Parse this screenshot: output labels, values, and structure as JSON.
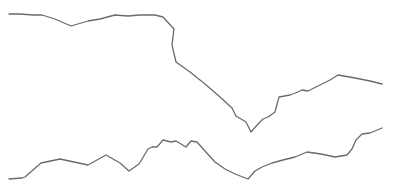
{
  "chart_data": {
    "type": "line",
    "title": "",
    "xlabel": "",
    "ylabel": "",
    "grid": false,
    "legend": "none",
    "axes_visible": false,
    "line_color": "#6b6b6b",
    "background": "#ffffff",
    "series": [
      {
        "name": "upper",
        "points": [
          [
            9,
            14
          ],
          [
            20,
            14
          ],
          [
            33,
            15
          ],
          [
            42,
            15
          ],
          [
            55,
            19
          ],
          [
            71,
            26
          ],
          [
            88,
            21
          ],
          [
            100,
            19
          ],
          [
            115,
            15
          ],
          [
            128,
            16
          ],
          [
            140,
            15
          ],
          [
            155,
            15
          ],
          [
            163,
            17
          ],
          [
            174,
            29
          ],
          [
            172,
            45
          ],
          [
            176,
            62
          ],
          [
            190,
            72
          ],
          [
            205,
            84
          ],
          [
            220,
            97
          ],
          [
            232,
            108
          ],
          [
            236,
            116
          ],
          [
            246,
            122
          ],
          [
            251,
            132
          ],
          [
            258,
            124
          ],
          [
            263,
            119
          ],
          [
            268,
            117
          ],
          [
            275,
            112
          ],
          [
            279,
            97
          ],
          [
            290,
            95
          ],
          [
            298,
            92
          ],
          [
            302,
            90
          ],
          [
            308,
            91
          ],
          [
            318,
            86
          ],
          [
            330,
            80
          ],
          [
            338,
            75
          ],
          [
            355,
            78
          ],
          [
            370,
            81
          ],
          [
            382,
            84
          ]
        ]
      },
      {
        "name": "lower",
        "points": [
          [
            9,
            179
          ],
          [
            22,
            178
          ],
          [
            25,
            177
          ],
          [
            33,
            170
          ],
          [
            41,
            163
          ],
          [
            60,
            159
          ],
          [
            74,
            162
          ],
          [
            88,
            165
          ],
          [
            106,
            155
          ],
          [
            120,
            163
          ],
          [
            129,
            171
          ],
          [
            139,
            164
          ],
          [
            148,
            149
          ],
          [
            152,
            147
          ],
          [
            157,
            147
          ],
          [
            163,
            140
          ],
          [
            171,
            142
          ],
          [
            176,
            141
          ],
          [
            186,
            147
          ],
          [
            191,
            141
          ],
          [
            197,
            142
          ],
          [
            205,
            151
          ],
          [
            215,
            162
          ],
          [
            225,
            169
          ],
          [
            235,
            174
          ],
          [
            248,
            179
          ],
          [
            255,
            171
          ],
          [
            262,
            167
          ],
          [
            272,
            163
          ],
          [
            283,
            160
          ],
          [
            295,
            157
          ],
          [
            307,
            152
          ],
          [
            321,
            154
          ],
          [
            335,
            157
          ],
          [
            347,
            155
          ],
          [
            352,
            149
          ],
          [
            356,
            140
          ],
          [
            362,
            134
          ],
          [
            370,
            133
          ],
          [
            382,
            128
          ]
        ]
      }
    ]
  }
}
